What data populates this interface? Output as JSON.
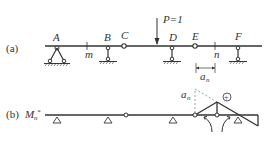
{
  "figure": {
    "part_a": {
      "label": "(a)",
      "load": {
        "text": "P=1"
      },
      "points": {
        "A": "A",
        "B": "B",
        "C": "C",
        "D": "D",
        "E": "E",
        "F": "F",
        "m": "m",
        "n": "n"
      },
      "dimension": {
        "symbol": "a",
        "subscript": "n"
      }
    },
    "part_b": {
      "label": "(b)",
      "influence_line": {
        "symbol": "M",
        "subscript": "n",
        "superscript": "*"
      },
      "ordinate": {
        "symbol": "a",
        "subscript": "n"
      },
      "sign": "+"
    }
  },
  "colors": {
    "line": "#333333",
    "dashed": "#888888",
    "background": "#ffffff"
  }
}
